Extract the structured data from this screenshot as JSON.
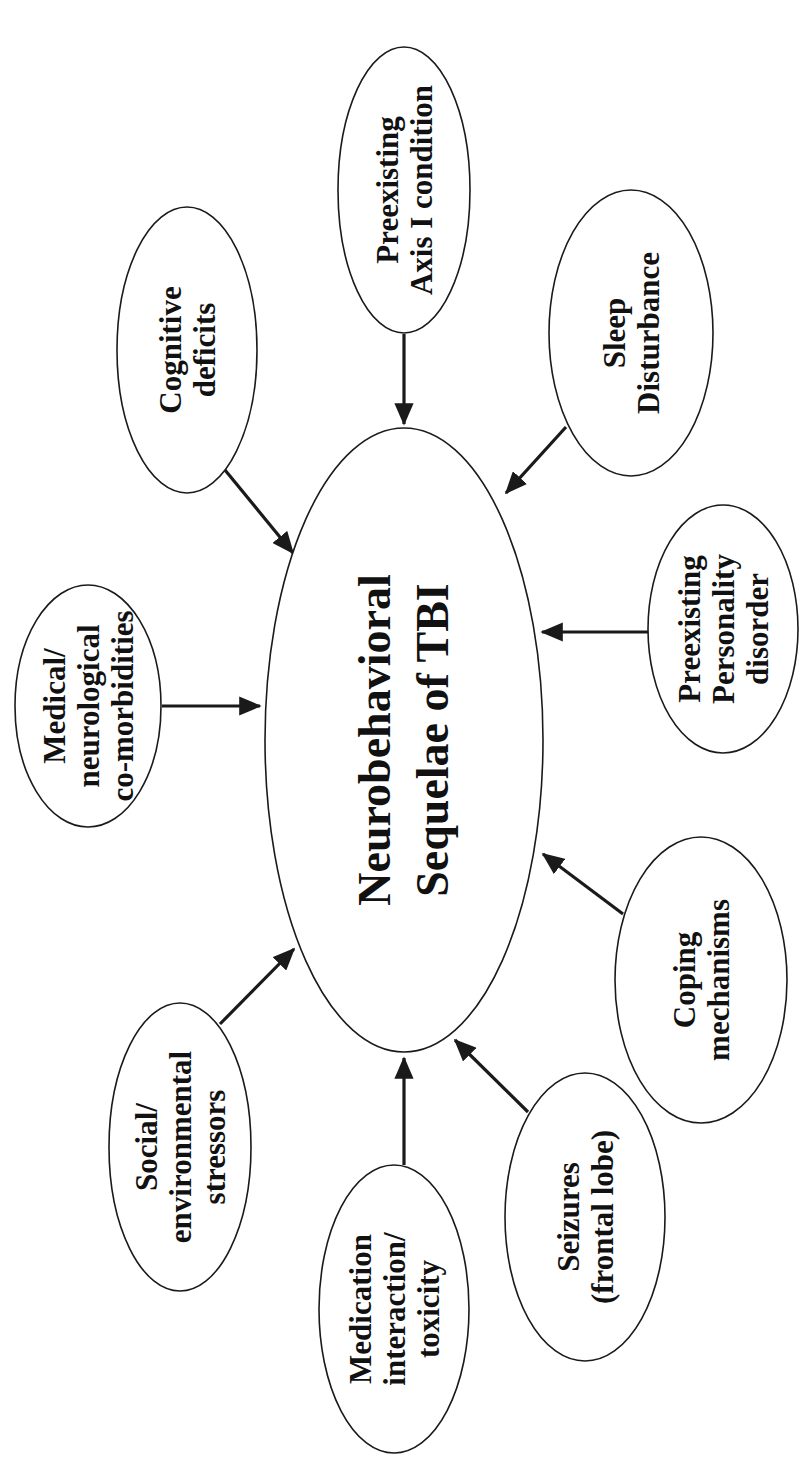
{
  "diagram": {
    "orientation": "rotated -90 degrees (text reads bottom-to-top)",
    "center": {
      "lines": [
        "Neurobehavioral",
        "Sequelae of TBI"
      ]
    },
    "factors": [
      {
        "id": "cognitive-deficits",
        "lines": [
          "Cognitive",
          "deficits"
        ]
      },
      {
        "id": "preexisting-axis-i",
        "lines": [
          "Preexisting",
          "Axis I condition"
        ]
      },
      {
        "id": "sleep-disturbance",
        "lines": [
          "Sleep",
          "Disturbance"
        ]
      },
      {
        "id": "medical-neurological",
        "lines": [
          "Medical/",
          "neurological",
          "co-morbidities"
        ]
      },
      {
        "id": "preexisting-personality",
        "lines": [
          "Preexisting",
          "Personality",
          "disorder"
        ]
      },
      {
        "id": "social-environmental",
        "lines": [
          "Social/",
          "environmental",
          "stressors"
        ]
      },
      {
        "id": "coping-mechanisms",
        "lines": [
          "Coping",
          "mechanisms"
        ]
      },
      {
        "id": "medication-interaction",
        "lines": [
          "Medication",
          "interaction/",
          "toxicity"
        ]
      },
      {
        "id": "seizures",
        "lines": [
          "Seizures",
          "(frontal lobe)"
        ]
      }
    ],
    "edges": [
      {
        "from": "cognitive-deficits",
        "to": "center"
      },
      {
        "from": "preexisting-axis-i",
        "to": "center"
      },
      {
        "from": "sleep-disturbance",
        "to": "center"
      },
      {
        "from": "medical-neurological",
        "to": "center"
      },
      {
        "from": "preexisting-personality",
        "to": "center"
      },
      {
        "from": "social-environmental",
        "to": "center"
      },
      {
        "from": "coping-mechanisms",
        "to": "center"
      },
      {
        "from": "medication-interaction",
        "to": "center"
      },
      {
        "from": "seizures",
        "to": "center"
      }
    ],
    "colors": {
      "stroke": "#1a1a1a",
      "fill": "#ffffff",
      "text": "#111111"
    }
  }
}
